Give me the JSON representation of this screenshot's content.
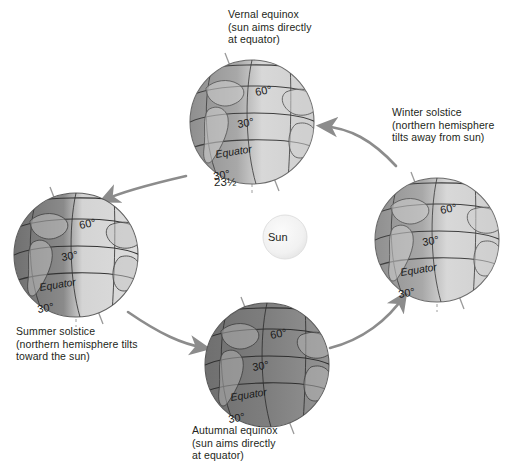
{
  "diagram": {
    "background_color": "#ffffff"
  },
  "sun": {
    "label": "Sun",
    "fill_color": "#f2f2f2",
    "cx": 285,
    "cy": 237,
    "r": 22
  },
  "captions": {
    "vernal": "Vernal equinox\n(sun aims directly\nat equator)",
    "winter": "Winter solstice\n(northern hemisphere\ntilts away from sun)",
    "summer": "Summer solstice\n(northern hemisphere tilts\ntoward the sun)",
    "autumnal": "Autumnal equinox\n(sun aims directly\nat equator)"
  },
  "tilt_annotation": {
    "label": "23½",
    "meaning": "axial tilt in degrees"
  },
  "globes": [
    {
      "name": "vernal-equinox-globe",
      "position": "top",
      "cx": 252,
      "cy": 122,
      "r": 62,
      "lit_side": "right",
      "shading": "half-lit",
      "labels": [
        "60°",
        "30°",
        "Equator",
        "30°"
      ]
    },
    {
      "name": "winter-solstice-globe",
      "position": "right",
      "cx": 437,
      "cy": 240,
      "r": 62,
      "lit_side": "right",
      "shading": "half-lit",
      "labels": [
        "60°",
        "30°",
        "Equator",
        "30°"
      ]
    },
    {
      "name": "autumnal-equinox-globe",
      "position": "bottom",
      "cx": 267,
      "cy": 365,
      "r": 62,
      "lit_side": "right",
      "shading": "dark",
      "labels": [
        "60°",
        "30°",
        "Equator",
        "30°"
      ]
    },
    {
      "name": "summer-solstice-globe",
      "position": "left",
      "cx": 76,
      "cy": 255,
      "r": 62,
      "lit_side": "right",
      "shading": "half-lit",
      "labels": [
        "60°",
        "30°",
        "Equator",
        "30°"
      ]
    }
  ],
  "latitude_labels": {
    "north_60": "60°",
    "north_30": "30°",
    "equator": "Equator",
    "south_30": "30°"
  },
  "orbit_arrows": [
    {
      "name": "arrow-winter-to-vernal",
      "direction": "leftward",
      "color": "#8c8c8c"
    },
    {
      "name": "arrow-vernal-to-summer",
      "direction": "down-left",
      "color": "#8c8c8c"
    },
    {
      "name": "arrow-summer-to-autumnal",
      "direction": "rightward",
      "color": "#8c8c8c"
    },
    {
      "name": "arrow-autumnal-to-winter",
      "direction": "up-right",
      "color": "#8c8c8c"
    }
  ],
  "colors": {
    "globe_light": "#d9d9d9",
    "globe_mid": "#b3b3b3",
    "globe_dark": "#8a8a8a",
    "globe_darkest": "#6e6e6e",
    "outline": "#4d4d4d",
    "arrow": "#8c8c8c",
    "text": "#231f20",
    "sun": "#f2f2f2"
  }
}
